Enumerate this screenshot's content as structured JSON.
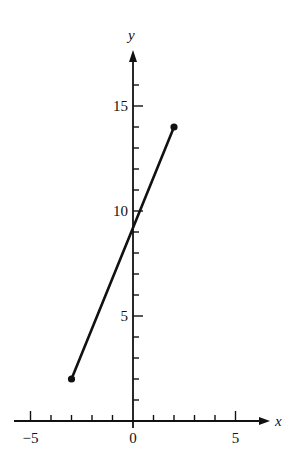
{
  "chart_data": {
    "type": "line",
    "title": "",
    "xlabel": "x",
    "ylabel": "y",
    "xlim": [
      -5.9,
      6.5
    ],
    "ylim": [
      0,
      17.5
    ],
    "x_ticks": [
      -5,
      -4,
      -3,
      -2,
      -1,
      0,
      1,
      2,
      3,
      4,
      5
    ],
    "x_tick_labels": [
      {
        "value": -5,
        "label": "−5"
      },
      {
        "value": 0,
        "label": "0"
      },
      {
        "value": 5,
        "label": "5"
      }
    ],
    "y_ticks": [
      1,
      2,
      3,
      4,
      5,
      6,
      7,
      8,
      9,
      10,
      11,
      12,
      13,
      14,
      15,
      16
    ],
    "y_tick_labels": [
      {
        "value": 5,
        "label": "5"
      },
      {
        "value": 10,
        "label": "10"
      },
      {
        "value": 15,
        "label": "15"
      }
    ],
    "grid": false,
    "legend": null,
    "series": [
      {
        "name": "segment",
        "points": [
          {
            "x": -3,
            "y": 2
          },
          {
            "x": 2,
            "y": 14
          }
        ],
        "endpoint_markers": "filled-dot",
        "color": "#111111"
      }
    ]
  },
  "colors": {
    "ink": "#111111",
    "background": "#ffffff"
  }
}
